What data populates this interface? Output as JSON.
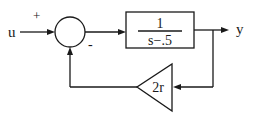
{
  "diagram": {
    "type": "block-diagram",
    "input": {
      "label": "u",
      "sign": "+"
    },
    "summing_junction": {
      "feedback_sign": "-"
    },
    "forward_block": {
      "transfer_function": {
        "numerator": "1",
        "denominator": "s−.5"
      }
    },
    "output": {
      "label": "y"
    },
    "feedback_block": {
      "shape": "triangle-gain",
      "gain": "2r"
    },
    "colors": {
      "stroke": "#1a1a1a",
      "background": "#ffffff"
    }
  }
}
